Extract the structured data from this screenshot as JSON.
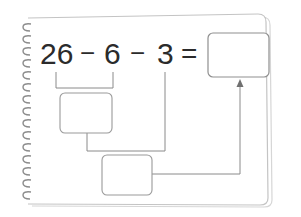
{
  "worksheet": {
    "equation": {
      "terms": [
        {
          "id": "term-1",
          "value": "26"
        },
        {
          "id": "op-1",
          "value": "−"
        },
        {
          "id": "term-2",
          "value": "6"
        },
        {
          "id": "op-2",
          "value": "−"
        },
        {
          "id": "term-3",
          "value": "3"
        },
        {
          "id": "equals",
          "value": "="
        }
      ],
      "answer_box": ""
    },
    "intermediate_boxes": [
      {
        "id": "step-1-box",
        "value": "",
        "connects": [
          "26",
          "6"
        ]
      },
      {
        "id": "step-2-box",
        "value": "",
        "connects": [
          "step-1-box",
          "3"
        ]
      }
    ],
    "colors": {
      "text": "#2b2b2b",
      "line": "#8a8a8a",
      "box_border": "#9a9a9a",
      "page_border": "#c8c8c8",
      "spiral": "#8c8c8c"
    }
  }
}
